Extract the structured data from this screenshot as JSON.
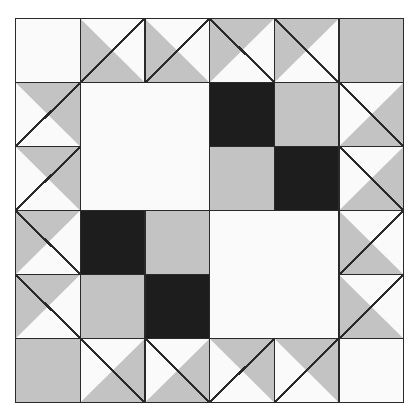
{
  "artwork": {
    "title": "Quilt Block Pattern",
    "kind": "pieced-quilt-block-diagram",
    "grid_columns": 6,
    "grid_rows": 6,
    "background_color": "#ffffff",
    "outline_color": "#2a2a2a"
  },
  "palette": {
    "white": "#fafafa",
    "gray": "#c3c3c3",
    "black": "#1d1d1d",
    "line": "#2a2a2a"
  },
  "patches": [
    {
      "id": "r1c1",
      "row": 1,
      "col": 1,
      "shape": "square",
      "fill": "white"
    },
    {
      "id": "r1c2",
      "row": 1,
      "col": 2,
      "shape": "half-square-triangle",
      "back": "white",
      "front": "gray",
      "front_half": "lower-left",
      "diagonal": "tl-br"
    },
    {
      "id": "r1c3",
      "row": 1,
      "col": 3,
      "shape": "half-square-triangle",
      "back": "white",
      "front": "gray",
      "front_half": "lower-left",
      "diagonal": "tl-br"
    },
    {
      "id": "r1c4",
      "row": 1,
      "col": 4,
      "shape": "half-square-triangle",
      "back": "white",
      "front": "gray",
      "front_half": "upper-left",
      "diagonal": "bl-tr"
    },
    {
      "id": "r1c5",
      "row": 1,
      "col": 5,
      "shape": "half-square-triangle",
      "back": "white",
      "front": "gray",
      "front_half": "upper-left",
      "diagonal": "bl-tr"
    },
    {
      "id": "r1c6",
      "row": 1,
      "col": 6,
      "shape": "square",
      "fill": "gray"
    },
    {
      "id": "r2c1",
      "row": 2,
      "col": 1,
      "shape": "half-square-triangle",
      "back": "white",
      "front": "gray",
      "front_half": "upper-right",
      "diagonal": "tl-br"
    },
    {
      "id": "r2c2",
      "row": 2,
      "col": 2,
      "shape": "large-square-2x2",
      "fill": "white"
    },
    {
      "id": "r2c4",
      "row": 2,
      "col": 4,
      "shape": "square",
      "fill": "black"
    },
    {
      "id": "r2c5",
      "row": 2,
      "col": 5,
      "shape": "square",
      "fill": "gray"
    },
    {
      "id": "r2c6",
      "row": 2,
      "col": 6,
      "shape": "half-square-triangle",
      "back": "white",
      "front": "gray",
      "front_half": "lower-right",
      "diagonal": "bl-tr"
    },
    {
      "id": "r3c1",
      "row": 3,
      "col": 1,
      "shape": "half-square-triangle",
      "back": "white",
      "front": "gray",
      "front_half": "upper-right",
      "diagonal": "tl-br"
    },
    {
      "id": "r3c4",
      "row": 3,
      "col": 4,
      "shape": "square",
      "fill": "gray"
    },
    {
      "id": "r3c5",
      "row": 3,
      "col": 5,
      "shape": "square",
      "fill": "black"
    },
    {
      "id": "r3c6",
      "row": 3,
      "col": 6,
      "shape": "half-square-triangle",
      "back": "white",
      "front": "gray",
      "front_half": "lower-right",
      "diagonal": "bl-tr"
    },
    {
      "id": "r4c1",
      "row": 4,
      "col": 1,
      "shape": "half-square-triangle",
      "back": "white",
      "front": "gray",
      "front_half": "upper-left",
      "diagonal": "bl-tr"
    },
    {
      "id": "r4c2",
      "row": 4,
      "col": 2,
      "shape": "square",
      "fill": "black"
    },
    {
      "id": "r4c3",
      "row": 4,
      "col": 3,
      "shape": "square",
      "fill": "gray"
    },
    {
      "id": "r4c4",
      "row": 4,
      "col": 4,
      "shape": "large-square-2x2",
      "fill": "white"
    },
    {
      "id": "r4c6",
      "row": 4,
      "col": 6,
      "shape": "half-square-triangle",
      "back": "white",
      "front": "gray",
      "front_half": "lower-left",
      "diagonal": "tl-br"
    },
    {
      "id": "r5c1",
      "row": 5,
      "col": 1,
      "shape": "half-square-triangle",
      "back": "white",
      "front": "gray",
      "front_half": "upper-left",
      "diagonal": "bl-tr"
    },
    {
      "id": "r5c2",
      "row": 5,
      "col": 2,
      "shape": "square",
      "fill": "gray"
    },
    {
      "id": "r5c3",
      "row": 5,
      "col": 3,
      "shape": "square",
      "fill": "black"
    },
    {
      "id": "r5c6",
      "row": 5,
      "col": 6,
      "shape": "half-square-triangle",
      "back": "white",
      "front": "gray",
      "front_half": "lower-left",
      "diagonal": "tl-br"
    },
    {
      "id": "r6c1",
      "row": 6,
      "col": 1,
      "shape": "square",
      "fill": "gray"
    },
    {
      "id": "r6c2",
      "row": 6,
      "col": 2,
      "shape": "half-square-triangle",
      "back": "white",
      "front": "gray",
      "front_half": "lower-right",
      "diagonal": "bl-tr"
    },
    {
      "id": "r6c3",
      "row": 6,
      "col": 3,
      "shape": "half-square-triangle",
      "back": "white",
      "front": "gray",
      "front_half": "lower-right",
      "diagonal": "bl-tr"
    },
    {
      "id": "r6c4",
      "row": 6,
      "col": 4,
      "shape": "half-square-triangle",
      "back": "white",
      "front": "gray",
      "front_half": "upper-right",
      "diagonal": "tl-br"
    },
    {
      "id": "r6c5",
      "row": 6,
      "col": 5,
      "shape": "half-square-triangle",
      "back": "white",
      "front": "gray",
      "front_half": "upper-right",
      "diagonal": "tl-br"
    },
    {
      "id": "r6c6",
      "row": 6,
      "col": 6,
      "shape": "square",
      "fill": "white"
    }
  ]
}
